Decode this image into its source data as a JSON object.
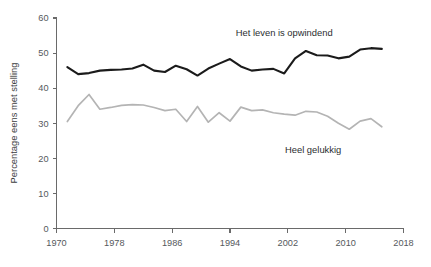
{
  "chart_data": {
    "type": "line",
    "title": "",
    "subtitle": "",
    "xlabel": "",
    "ylabel": "Percentage eens met stelling",
    "xlim": [
      1970,
      2018
    ],
    "ylim": [
      0,
      60
    ],
    "xticks": [
      1970,
      1978,
      1986,
      1994,
      2002,
      2010,
      2018
    ],
    "xtick_labels": [
      "1970",
      "1978",
      "1986",
      "1994",
      "2002",
      "2010",
      "2018"
    ],
    "yticks": [
      0,
      10,
      20,
      30,
      40,
      50,
      60
    ],
    "ytick_labels": [
      "0",
      "10",
      "20",
      "30",
      "40",
      "50",
      "60"
    ],
    "grid": false,
    "legend": "inline-annotations",
    "series": [
      {
        "name": "Het leven is opwindend",
        "color": "#1b1b1b",
        "label_x": 2001.5,
        "label_y": 55.0,
        "x": [
          1971.5,
          1973,
          1974.5,
          1976,
          1977.5,
          1979,
          1980.5,
          1982,
          1983.5,
          1985,
          1986.5,
          1988,
          1989.5,
          1991,
          1992.5,
          1994,
          1995.5,
          1997,
          1998.5,
          2000,
          2001.5,
          2003,
          2004.5,
          2006,
          2007.5,
          2009,
          2010.5,
          2012,
          2013.5,
          2015
        ],
        "values": [
          46.0,
          44.0,
          44.3,
          45.0,
          45.2,
          45.3,
          45.6,
          46.7,
          45.0,
          44.6,
          46.4,
          45.4,
          43.6,
          45.6,
          47.0,
          48.3,
          46.2,
          45.0,
          45.3,
          45.5,
          44.2,
          48.5,
          50.6,
          49.4,
          49.3,
          48.5,
          49.0,
          51.0,
          51.4,
          51.2
        ]
      },
      {
        "name": "Heel gelukkig",
        "color": "#b4b4b4",
        "label_x": 2005.5,
        "label_y": 21.5,
        "x": [
          1971.5,
          1973,
          1974.5,
          1976,
          1977.5,
          1979,
          1980.5,
          1982,
          1983.5,
          1985,
          1986.5,
          1988,
          1989.5,
          1991,
          1992.5,
          1994,
          1995.5,
          1997,
          1998.5,
          2000,
          2001.5,
          2003,
          2004.5,
          2006,
          2007.5,
          2009,
          2010.5,
          2012,
          2013.5,
          2015
        ],
        "values": [
          30.5,
          35.0,
          38.2,
          34.0,
          34.5,
          35.1,
          35.3,
          35.2,
          34.5,
          33.6,
          34.0,
          30.5,
          34.8,
          30.3,
          33.0,
          30.6,
          34.6,
          33.6,
          33.8,
          33.0,
          32.6,
          32.3,
          33.4,
          33.2,
          32.0,
          30.0,
          28.3,
          30.6,
          31.3,
          29.0
        ]
      }
    ]
  },
  "axes": {
    "y_title": "Percentage eens met stelling"
  }
}
